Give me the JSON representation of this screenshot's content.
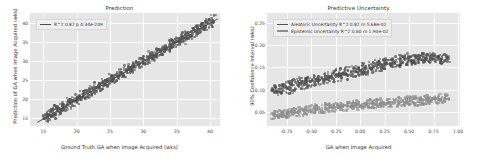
{
  "figure": {
    "background": "#ffffff",
    "axes_facecolor": "#e6e6e6",
    "grid_color": "#fdfdfd"
  },
  "chart_data": [
    {
      "type": "scatter",
      "panel": "left",
      "title": "Prediction",
      "xlabel": "Ground Truth GA when Image Acquired (wks)",
      "ylabel": "Prediction of GA when Image Acquired (wks)",
      "xlim": [
        13.0,
        41.5
      ],
      "ylim": [
        13.0,
        42.5
      ],
      "xticks": [
        15,
        20,
        25,
        30,
        35,
        40
      ],
      "yticks": [
        15,
        20,
        25,
        30,
        35,
        40
      ],
      "xticklabels": [
        "15",
        "20",
        "25",
        "30",
        "35",
        "40"
      ],
      "yticklabels": [
        "15",
        "20",
        "25",
        "30",
        "35",
        "40"
      ],
      "grid": true,
      "legend_position": "upper left",
      "legend": [
        {
          "label": "R^2 0.82 p 4.34e-209",
          "color": "#4a4a4a",
          "type": "line"
        }
      ],
      "marker_color": "#545454",
      "fit_line": {
        "slope": 1.0,
        "intercept": 0.0,
        "color": "#4a4a4a"
      },
      "n_points": 700,
      "series": [
        {
          "name": "predictions",
          "x": [
            15.2,
            15.5,
            15.8,
            16.1,
            16.4,
            16.0,
            15.3,
            16.8,
            17.2,
            17.5,
            17.0,
            16.5,
            17.9,
            18.3,
            18.6,
            18.1,
            17.6,
            19.0,
            19.4,
            19.7,
            19.2,
            18.8,
            20.1,
            20.5,
            20.8,
            20.3,
            19.9,
            21.2,
            21.6,
            21.9,
            21.4,
            21.0,
            22.3,
            22.7,
            23.0,
            22.5,
            22.1,
            23.4,
            23.8,
            24.1,
            23.6,
            23.2,
            24.5,
            24.9,
            25.2,
            24.7,
            24.3,
            25.6,
            26.0,
            26.3,
            25.8,
            25.4,
            26.7,
            27.1,
            27.4,
            26.9,
            26.5,
            27.8,
            28.2,
            28.5,
            28.0,
            27.6,
            28.9,
            29.3,
            29.6,
            29.1,
            28.7,
            30.0,
            30.4,
            30.7,
            30.2,
            29.8,
            31.1,
            31.5,
            31.8,
            31.3,
            30.9,
            32.2,
            32.6,
            32.9,
            32.4,
            32.0,
            33.3,
            33.7,
            34.0,
            33.5,
            33.1,
            34.4,
            34.8,
            35.1,
            34.6,
            34.2,
            35.5,
            35.9,
            36.2,
            35.7,
            35.3,
            36.6,
            37.0,
            37.3,
            36.8,
            36.4,
            37.7,
            38.1,
            38.4,
            37.9,
            37.5,
            38.8,
            39.2,
            39.5,
            39.0,
            38.6,
            39.9,
            40.3,
            40.6,
            40.1,
            39.7
          ],
          "y": [
            15.4,
            15.1,
            16.2,
            16.6,
            16.0,
            15.7,
            14.8,
            17.1,
            16.9,
            17.8,
            17.4,
            16.3,
            18.1,
            18.0,
            19.0,
            17.9,
            17.2,
            19.3,
            19.1,
            20.2,
            19.0,
            18.4,
            20.4,
            20.1,
            21.3,
            20.0,
            19.6,
            21.5,
            21.2,
            22.4,
            21.1,
            20.7,
            22.6,
            22.3,
            23.5,
            22.2,
            21.8,
            23.7,
            23.4,
            24.6,
            23.3,
            22.9,
            24.8,
            24.5,
            25.7,
            24.4,
            24.0,
            25.9,
            25.6,
            26.8,
            25.5,
            25.1,
            27.0,
            26.7,
            27.9,
            26.6,
            26.2,
            28.1,
            27.8,
            29.0,
            27.7,
            27.3,
            29.2,
            28.9,
            30.1,
            28.8,
            28.4,
            30.3,
            30.0,
            31.2,
            29.9,
            29.5,
            31.4,
            31.1,
            32.3,
            31.0,
            30.6,
            32.5,
            32.2,
            33.4,
            32.1,
            31.7,
            33.6,
            33.3,
            34.5,
            33.2,
            32.8,
            34.7,
            34.4,
            35.6,
            34.3,
            33.9,
            35.8,
            35.5,
            36.7,
            35.4,
            35.0,
            36.9,
            36.6,
            37.8,
            36.5,
            36.1,
            38.0,
            37.7,
            38.9,
            37.6,
            37.2,
            39.1,
            38.8,
            40.0,
            38.7,
            38.3,
            40.2,
            39.9,
            41.1,
            39.8,
            39.4
          ]
        }
      ]
    },
    {
      "type": "scatter",
      "panel": "right",
      "title": "Predictive Uncertainty",
      "xlabel": "GA when Image Acquired",
      "ylabel": "90% Confidence Interval (wks)",
      "xlim": [
        -0.95,
        1.02
      ],
      "ylim": [
        0.018,
        0.272
      ],
      "xticks": [
        -0.75,
        -0.5,
        -0.25,
        0.0,
        0.25,
        0.5,
        0.75,
        1.0
      ],
      "yticks": [
        0.05,
        0.1,
        0.15,
        0.2,
        0.25
      ],
      "xticklabels": [
        "-0.75",
        "-0.50",
        "-0.25",
        "0.00",
        "0.25",
        "0.50",
        "0.75",
        "1.00"
      ],
      "yticklabels": [
        "0.05",
        "0.10",
        "0.15",
        "0.20",
        "0.25"
      ],
      "grid": true,
      "legend_position": "upper left",
      "legend": [
        {
          "label": "Aleatoric Uncertainty R^2 0.82 m 5.68e-02",
          "color": "#4f4f4f",
          "type": "line"
        },
        {
          "label": "Epistemic Uncertainty R^2 0.60 m 1.90e-02",
          "color": "#8e8e8e",
          "type": "line"
        }
      ],
      "series": [
        {
          "name": "Aleatoric Uncertainty",
          "color": "#4f4f4f",
          "slope": 0.0568,
          "r2": 0.82,
          "x": [
            -0.88,
            -0.85,
            -0.82,
            -0.79,
            -0.76,
            -0.73,
            -0.7,
            -0.67,
            -0.64,
            -0.61,
            -0.58,
            -0.55,
            -0.52,
            -0.49,
            -0.46,
            -0.43,
            -0.4,
            -0.37,
            -0.34,
            -0.31,
            -0.28,
            -0.25,
            -0.22,
            -0.19,
            -0.16,
            -0.13,
            -0.1,
            -0.07,
            -0.04,
            -0.01,
            0.02,
            0.05,
            0.08,
            0.11,
            0.14,
            0.17,
            0.2,
            0.23,
            0.26,
            0.29,
            0.32,
            0.35,
            0.38,
            0.41,
            0.44,
            0.47,
            0.5,
            0.53,
            0.56,
            0.59,
            0.62,
            0.65,
            0.68,
            0.71,
            0.74,
            0.77,
            0.8,
            0.83,
            0.86,
            0.89
          ],
          "y": [
            0.098,
            0.103,
            0.095,
            0.108,
            0.101,
            0.112,
            0.099,
            0.115,
            0.106,
            0.118,
            0.11,
            0.121,
            0.113,
            0.124,
            0.116,
            0.127,
            0.119,
            0.13,
            0.122,
            0.133,
            0.125,
            0.136,
            0.128,
            0.139,
            0.131,
            0.142,
            0.134,
            0.145,
            0.137,
            0.148,
            0.14,
            0.151,
            0.143,
            0.154,
            0.146,
            0.157,
            0.149,
            0.16,
            0.152,
            0.163,
            0.155,
            0.166,
            0.158,
            0.169,
            0.161,
            0.172,
            0.164,
            0.167,
            0.17,
            0.166,
            0.173,
            0.168,
            0.171,
            0.169,
            0.174,
            0.17,
            0.172,
            0.168,
            0.171,
            0.167
          ]
        },
        {
          "name": "Epistemic Uncertainty",
          "color": "#8e8e8e",
          "slope": 0.019,
          "r2": 0.6,
          "x": [
            -0.88,
            -0.85,
            -0.82,
            -0.79,
            -0.76,
            -0.73,
            -0.7,
            -0.67,
            -0.64,
            -0.61,
            -0.58,
            -0.55,
            -0.52,
            -0.49,
            -0.46,
            -0.43,
            -0.4,
            -0.37,
            -0.34,
            -0.31,
            -0.28,
            -0.25,
            -0.22,
            -0.19,
            -0.16,
            -0.13,
            -0.1,
            -0.07,
            -0.04,
            -0.01,
            0.02,
            0.05,
            0.08,
            0.11,
            0.14,
            0.17,
            0.2,
            0.23,
            0.26,
            0.29,
            0.32,
            0.35,
            0.38,
            0.41,
            0.44,
            0.47,
            0.5,
            0.53,
            0.56,
            0.59,
            0.62,
            0.65,
            0.68,
            0.71,
            0.74,
            0.77,
            0.8,
            0.83,
            0.86,
            0.89
          ],
          "y": [
            0.041,
            0.045,
            0.039,
            0.048,
            0.043,
            0.05,
            0.044,
            0.052,
            0.046,
            0.054,
            0.048,
            0.056,
            0.05,
            0.058,
            0.052,
            0.06,
            0.054,
            0.062,
            0.055,
            0.063,
            0.057,
            0.064,
            0.058,
            0.066,
            0.059,
            0.067,
            0.06,
            0.068,
            0.061,
            0.069,
            0.062,
            0.07,
            0.063,
            0.071,
            0.064,
            0.072,
            0.065,
            0.073,
            0.066,
            0.074,
            0.067,
            0.075,
            0.068,
            0.076,
            0.069,
            0.077,
            0.07,
            0.078,
            0.071,
            0.079,
            0.072,
            0.08,
            0.073,
            0.081,
            0.074,
            0.082,
            0.075,
            0.083,
            0.076,
            0.084
          ]
        }
      ]
    }
  ]
}
